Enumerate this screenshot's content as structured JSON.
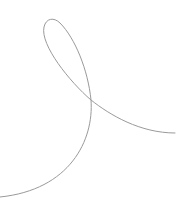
{
  "canvas": {
    "width": 195,
    "height": 211,
    "background": "#ffffff"
  },
  "curve": {
    "stroke": "#9a9a9a",
    "stroke_width": 1,
    "shape": "looped-ribbon-curve",
    "path": "M175,133 C140,133 110,115 91,100 C70,82 40,45 44,27 C46,18 54,17 60,23 C75,38 88,70 91,100 C94,140 70,190 0,197"
  }
}
